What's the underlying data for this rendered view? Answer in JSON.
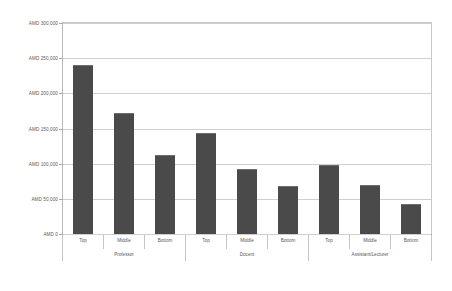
{
  "chart_data": {
    "type": "bar",
    "title": "",
    "subtitle": "",
    "xlabel": "",
    "ylabel": "",
    "ylim": [
      0,
      300000
    ],
    "grid": true,
    "legend": "none",
    "currency_prefix": "AMD",
    "y_ticks": [
      {
        "value": 300000,
        "label": "AMD 300,000"
      },
      {
        "value": 250000,
        "label": "AMD 250,000"
      },
      {
        "value": 200000,
        "label": "AMD 200,000"
      },
      {
        "value": 150000,
        "label": "AMD 150,000"
      },
      {
        "value": 100000,
        "label": "AMD 100,000"
      },
      {
        "value": 50000,
        "label": "AMD 50,000"
      },
      {
        "value": 0,
        "label": "AMD 0"
      }
    ],
    "categories": [
      "Top",
      "Middle",
      "Bottom",
      "Top",
      "Middle",
      "Bottom",
      "Top",
      "Middle",
      "Bottom"
    ],
    "values": [
      240000,
      172000,
      113000,
      143000,
      92000,
      68000,
      98000,
      70000,
      43000
    ],
    "groups": [
      {
        "name": "Professor",
        "span": 3
      },
      {
        "name": "Docent",
        "span": 3
      },
      {
        "name": "Assistant/Lecturer",
        "span": 3
      }
    ],
    "bar_color": "#4a4a4a",
    "gridline_color": "#cfcfcf",
    "axis_color": "#8e8e8e",
    "text_color": "#595959",
    "background": "#ffffff"
  }
}
